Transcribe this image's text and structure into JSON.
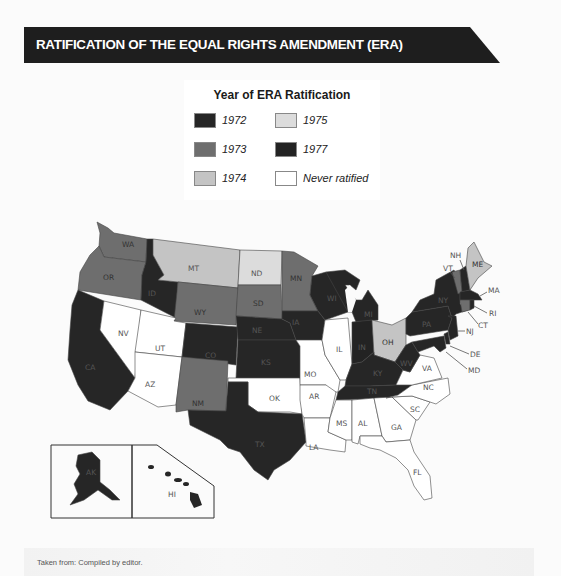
{
  "title": "RATIFICATION OF THE EQUAL RIGHTS AMENDMENT (ERA)",
  "legend": {
    "title": "Year of ERA Ratification",
    "items": [
      {
        "label": "1972",
        "color": "#262626"
      },
      {
        "label": "1973",
        "color": "#6e6e6e"
      },
      {
        "label": "1974",
        "color": "#c4c4c4"
      },
      {
        "label": "1975",
        "color": "#dcdcdc"
      },
      {
        "label": "1977",
        "color": "#232323"
      },
      {
        "label": "Never ratified",
        "color": "#ffffff"
      }
    ]
  },
  "colors": {
    "y1972": "#262626",
    "y1973": "#6e6e6e",
    "y1974": "#c4c4c4",
    "y1975": "#dcdcdc",
    "y1977": "#232323",
    "never": "#ffffff",
    "title_bar": "#1e1e1e"
  },
  "states": [
    {
      "abbr": "WA",
      "status": "1973"
    },
    {
      "abbr": "OR",
      "status": "1973"
    },
    {
      "abbr": "CA",
      "status": "1972"
    },
    {
      "abbr": "ID",
      "status": "1972"
    },
    {
      "abbr": "NV",
      "status": "Never ratified"
    },
    {
      "abbr": "MT",
      "status": "1974"
    },
    {
      "abbr": "WY",
      "status": "1973"
    },
    {
      "abbr": "UT",
      "status": "Never ratified"
    },
    {
      "abbr": "AZ",
      "status": "Never ratified"
    },
    {
      "abbr": "CO",
      "status": "1972"
    },
    {
      "abbr": "NM",
      "status": "1973"
    },
    {
      "abbr": "ND",
      "status": "1975"
    },
    {
      "abbr": "SD",
      "status": "1973"
    },
    {
      "abbr": "NE",
      "status": "1972"
    },
    {
      "abbr": "KS",
      "status": "1972"
    },
    {
      "abbr": "OK",
      "status": "Never ratified"
    },
    {
      "abbr": "TX",
      "status": "1972"
    },
    {
      "abbr": "MN",
      "status": "1973"
    },
    {
      "abbr": "IA",
      "status": "1972"
    },
    {
      "abbr": "MO",
      "status": "Never ratified"
    },
    {
      "abbr": "AR",
      "status": "Never ratified"
    },
    {
      "abbr": "LA",
      "status": "Never ratified"
    },
    {
      "abbr": "WI",
      "status": "1972"
    },
    {
      "abbr": "IL",
      "status": "Never ratified"
    },
    {
      "abbr": "MI",
      "status": "1972"
    },
    {
      "abbr": "IN",
      "status": "1977"
    },
    {
      "abbr": "OH",
      "status": "1974"
    },
    {
      "abbr": "KY",
      "status": "1972"
    },
    {
      "abbr": "TN",
      "status": "1972"
    },
    {
      "abbr": "MS",
      "status": "Never ratified"
    },
    {
      "abbr": "AL",
      "status": "Never ratified"
    },
    {
      "abbr": "GA",
      "status": "Never ratified"
    },
    {
      "abbr": "FL",
      "status": "Never ratified"
    },
    {
      "abbr": "SC",
      "status": "Never ratified"
    },
    {
      "abbr": "NC",
      "status": "Never ratified"
    },
    {
      "abbr": "VA",
      "status": "Never ratified"
    },
    {
      "abbr": "WV",
      "status": "1972"
    },
    {
      "abbr": "PA",
      "status": "1972"
    },
    {
      "abbr": "NY",
      "status": "1972"
    },
    {
      "abbr": "VT",
      "status": "1973"
    },
    {
      "abbr": "NH",
      "status": "1972"
    },
    {
      "abbr": "ME",
      "status": "1974"
    },
    {
      "abbr": "MA",
      "status": "1972"
    },
    {
      "abbr": "RI",
      "status": "1972"
    },
    {
      "abbr": "CT",
      "status": "1973"
    },
    {
      "abbr": "NJ",
      "status": "1972"
    },
    {
      "abbr": "DE",
      "status": "1972"
    },
    {
      "abbr": "MD",
      "status": "1972"
    },
    {
      "abbr": "AK",
      "status": "1972"
    },
    {
      "abbr": "HI",
      "status": "1972"
    }
  ],
  "labels": {
    "WA": "WA",
    "OR": "OR",
    "CA": "CA",
    "ID": "ID",
    "NV": "NV",
    "MT": "MT",
    "WY": "WY",
    "UT": "UT",
    "AZ": "AZ",
    "CO": "CO",
    "NM": "NM",
    "ND": "ND",
    "SD": "SD",
    "NE": "NE",
    "KS": "KS",
    "OK": "OK",
    "TX": "TX",
    "MN": "MN",
    "IA": "IA",
    "MO": "MO",
    "AR": "AR",
    "LA": "LA",
    "WI": "WI",
    "IL": "IL",
    "MI": "MI",
    "IN": "IN",
    "OH": "OH",
    "KY": "KY",
    "TN": "TN",
    "MS": "MS",
    "AL": "AL",
    "GA": "GA",
    "FL": "FL",
    "SC": "SC",
    "NC": "NC",
    "VA": "VA",
    "WV": "WV",
    "PA": "PA",
    "NY": "NY",
    "VT": "VT",
    "NH": "NH",
    "ME": "ME",
    "MA": "MA",
    "RI": "RI",
    "CT": "CT",
    "NJ": "NJ",
    "DE": "DE",
    "MD": "MD",
    "AK": "AK",
    "HI": "HI"
  },
  "source": "Taken from: Compiled by editor."
}
